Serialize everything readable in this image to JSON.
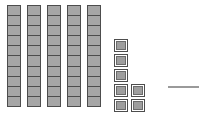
{
  "diagram": {
    "type": "base-ten-blocks",
    "title": "Base-ten blocks counting figure",
    "prompt_label": "",
    "colors": {
      "block_fill": "#a6a6a6",
      "block_border": "#4d4d4d",
      "background": "#ffffff",
      "answer_line": "#9a9a9a"
    },
    "tens": {
      "label": "tens rods",
      "rod_count": 5,
      "units_per_rod": 10,
      "total_units": 50,
      "rods": [
        {
          "index": 1,
          "units": 10
        },
        {
          "index": 2,
          "units": 10
        },
        {
          "index": 3,
          "units": 10
        },
        {
          "index": 4,
          "units": 10
        },
        {
          "index": 5,
          "units": 10
        }
      ]
    },
    "ones": {
      "label": "loose unit cubes",
      "count": 7,
      "rows": [
        {
          "index": 1,
          "units": 1
        },
        {
          "index": 2,
          "units": 1
        },
        {
          "index": 3,
          "units": 1
        },
        {
          "index": 4,
          "units": 2
        },
        {
          "index": 5,
          "units": 2
        }
      ]
    },
    "answer": {
      "label": "answer blank",
      "value": ""
    },
    "represented_number": 57
  },
  "chart_data": {
    "type": "bar",
    "categories": [
      "rod-1",
      "rod-2",
      "rod-3",
      "rod-4",
      "rod-5",
      "ones"
    ],
    "values": [
      10,
      10,
      10,
      10,
      10,
      7
    ],
    "xlabel": "",
    "ylabel": "units",
    "ylim": [
      0,
      10
    ]
  }
}
